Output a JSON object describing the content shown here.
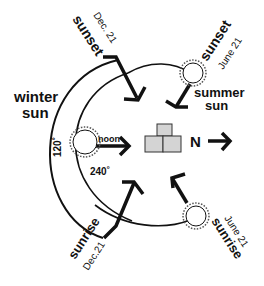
{
  "diagram": {
    "labels": {
      "winter_sun": [
        "winter",
        "sun"
      ],
      "summer_sun": [
        "summer",
        "sun"
      ],
      "sunset_dec": "sunset",
      "sunset_dec_date": "Dec. 21",
      "sunset_june": "sunset",
      "sunset_june_date": "June 21",
      "sunrise_dec": "sunrise",
      "sunrise_dec_date": "Dec.21",
      "sunrise_june": "sunrise",
      "sunrise_june_date": "June 21",
      "noon": "noon",
      "north": "N",
      "angle_120": "120˚",
      "angle_240": "240˚"
    },
    "colors": {
      "ink": "#111111",
      "house_fill": "#d4d4d4",
      "background": "#ffffff"
    }
  }
}
